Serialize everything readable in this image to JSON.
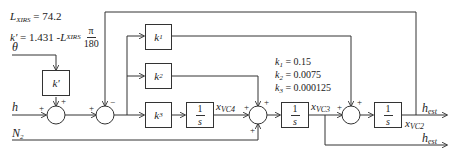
{
  "equations": {
    "l_xirs": {
      "symbol": "L",
      "subscript": "XIRS",
      "value": "= 74.2"
    },
    "k_prime": {
      "lhs": "k'",
      "rhs": "= 1.431 - ",
      "sym": "L",
      "subscript": "XIRS",
      "frac_num": "π",
      "frac_den": "180"
    }
  },
  "gains": [
    {
      "symbol": "k",
      "sub": "1",
      "value": "= 0.15"
    },
    {
      "symbol": "k",
      "sub": "2",
      "value": "= 0.0075"
    },
    {
      "symbol": "k",
      "sub": "3",
      "value": "= 0.000125"
    }
  ],
  "inputs": {
    "theta": "θ",
    "h": "h",
    "n2": {
      "symbol": "N",
      "sub": "2"
    }
  },
  "blocks": {
    "k_prime": "k'",
    "k1": {
      "symbol": "k",
      "sub": "1"
    },
    "k2": {
      "symbol": "k",
      "sub": "2"
    },
    "k3": {
      "symbol": "k",
      "sub": "3"
    },
    "integrator": {
      "num": "1",
      "den": "s"
    }
  },
  "signals": {
    "xvc4": {
      "symbol": "x",
      "sub": "VC4"
    },
    "xvc3": {
      "symbol": "x",
      "sub": "VC3"
    },
    "xvc2": {
      "symbol": "x",
      "sub": "VC2"
    },
    "h_est_1": {
      "symbol": "h",
      "sub": "est"
    },
    "h_est_2": {
      "symbol": "h",
      "sub": "est"
    }
  },
  "summing_signs": {
    "sum1": {
      "left": "+",
      "top": "+"
    },
    "sum2": {
      "left": "+",
      "top": "−"
    },
    "sum3": {
      "left": "+",
      "top": "+",
      "bottom": "+"
    },
    "sum4": {
      "left": "+",
      "top": "+"
    }
  },
  "colors": {
    "line": "#333333",
    "background": "#ffffff"
  }
}
